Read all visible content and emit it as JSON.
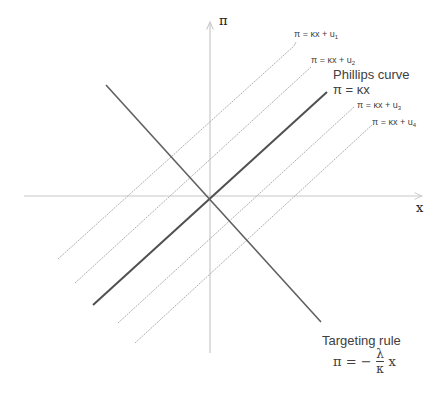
{
  "axes": {
    "y_label": "π",
    "x_label": "x",
    "axis_color": "#c8c8c8"
  },
  "lines": {
    "shock_lines": [
      {
        "label_main": "π = κx + u",
        "label_sub": "1"
      },
      {
        "label_main": "π = κx + u",
        "label_sub": "2"
      },
      {
        "label_main": "π = κx + u",
        "label_sub": "3"
      },
      {
        "label_main": "π = κx + u",
        "label_sub": "4"
      }
    ],
    "shock_color": "#b0b0b0",
    "phillips": {
      "title": "Phillips curve",
      "equation": "π = κx",
      "color": "#505050"
    },
    "targeting": {
      "title": "Targeting rule",
      "eq_lhs": "π = −",
      "eq_num": "λ",
      "eq_den": "κ",
      "eq_rhs": "x",
      "color": "#606060"
    }
  }
}
